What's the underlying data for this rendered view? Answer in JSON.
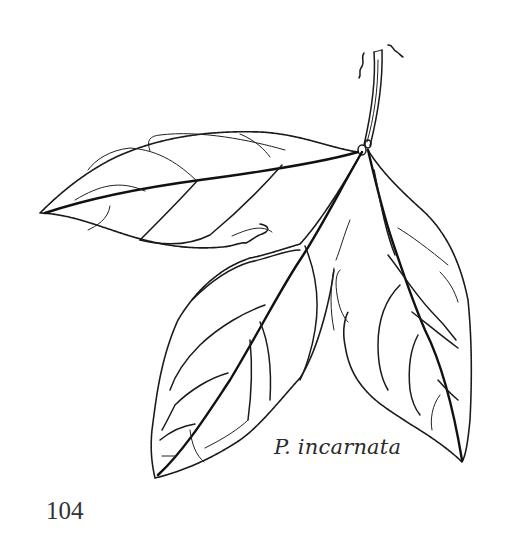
{
  "figure": {
    "caption": "P. incarnata"
  },
  "page": {
    "number": "104"
  },
  "colors": {
    "ink": "#1a1a1a",
    "paper": "#ffffff"
  }
}
